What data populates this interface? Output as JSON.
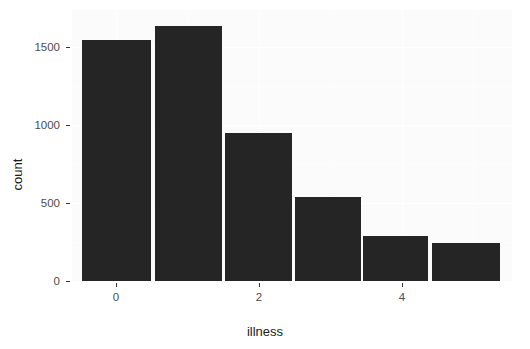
{
  "chart_data": {
    "type": "bar",
    "title": "",
    "subtitle": "",
    "xlabel": "illness",
    "ylabel": "count",
    "categories": [
      "0",
      "1",
      "2",
      "3",
      "4",
      "5"
    ],
    "values": [
      1545,
      1635,
      950,
      540,
      285,
      245
    ],
    "x_tick_labels": [
      "0",
      "2",
      "4"
    ],
    "x_tick_values": [
      0,
      2,
      4
    ],
    "y_tick_labels": [
      "0",
      "500",
      "1000",
      "1500"
    ],
    "y_tick_values": [
      0,
      500,
      1000,
      1500
    ],
    "xlim": [
      -0.6,
      5.6
    ],
    "ylim": [
      0,
      1735
    ],
    "grid": true,
    "legend": null,
    "bar_color": "#252525",
    "panel_background": "#fbfbfb",
    "gridline_color": "#ffffff",
    "annotations": []
  },
  "axes": {
    "y_title": "count",
    "x_title": "illness"
  }
}
